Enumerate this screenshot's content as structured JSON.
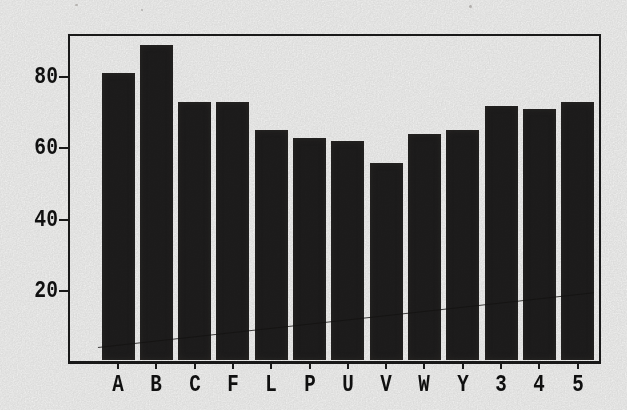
{
  "figure": {
    "background_color": "#fcfcfb",
    "frame_color": "#1c1c1c",
    "bar_color": "#201f1f",
    "text_color": "#121212",
    "title": ""
  },
  "chart_data": {
    "type": "bar",
    "title": "",
    "xlabel": "",
    "ylabel": "",
    "categories": [
      "A",
      "B",
      "C",
      "F",
      "L",
      "P",
      "U",
      "V",
      "W",
      "Y",
      "3",
      "4",
      "5"
    ],
    "values": [
      81,
      89,
      73,
      73,
      65,
      63,
      62,
      56,
      64,
      65,
      72,
      71,
      73
    ],
    "yticks": [
      20,
      40,
      60,
      80
    ],
    "ylim": [
      0,
      92
    ],
    "grid": false,
    "legend_position": "none",
    "bar_orientation": "vertical"
  }
}
